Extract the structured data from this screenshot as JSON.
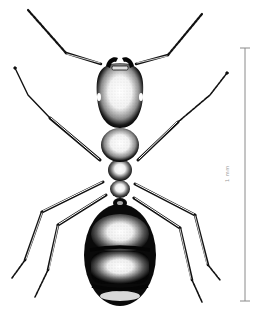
{
  "figure": {
    "view": "dorsal",
    "style": "stippled pen-and-ink illustration",
    "colors": {
      "ink": "#0a0a0a",
      "background": "#ffffff",
      "scale_bar": "#8a8a8a"
    }
  },
  "parts": {
    "antennae": [
      "left-antenna",
      "right-antenna"
    ],
    "body": [
      "head",
      "mandibles",
      "eyes",
      "pronotum",
      "mesonotum",
      "propodeum",
      "petiole",
      "gaster"
    ],
    "legs": [
      "front-left",
      "front-right",
      "mid-left",
      "mid-right",
      "hind-left",
      "hind-right"
    ]
  },
  "scale_bar": {
    "label": "1 mm"
  }
}
